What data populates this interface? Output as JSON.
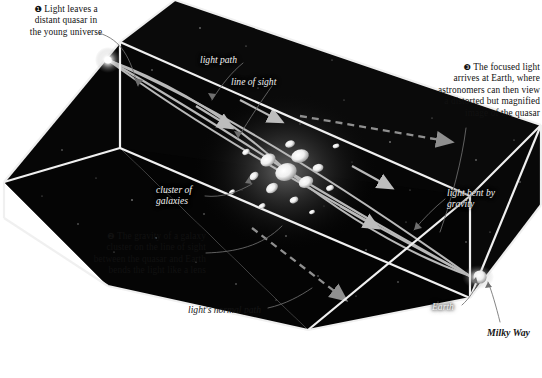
{
  "figure": {
    "background_color": "#ffffff",
    "box_fill": "#070707",
    "ray_color": "#b9b9b9",
    "dashed_ray_color": "#8f8f8f",
    "edge_color": "#f0f0f0",
    "label_color": "#f2f2f2",
    "caption_color": "#111111"
  },
  "captions": [
    {
      "marker": "❶",
      "text": "Light leaves a distant quasar in the young universe",
      "lines": [
        "Light leaves a",
        "distant quasar in",
        "the young universe"
      ]
    },
    {
      "marker": "❷",
      "text": "The gravity of a galaxy cluster on the line of sight between the quasar and Earth bends the light like a lens",
      "lines": [
        "The gravity of a galaxy",
        "cluster on the line of sight",
        "between the quasar and Earth",
        "bends the light like a lens"
      ]
    },
    {
      "marker": "❸",
      "text": "The focused light arrives at Earth, where astronomers can then view a distorted but magnified image of the quasar",
      "lines": [
        "The focused light",
        "arrives at Earth, where",
        "astronomers can then view",
        "a distorted but magnified",
        "image of the quasar"
      ]
    }
  ],
  "inner_labels": {
    "light_path": "light path",
    "line_of_sight": "line of sight",
    "cluster_line1": "cluster of",
    "cluster_line2": "galaxies",
    "bent_line1": "light bent by",
    "bent_line2": "gravity",
    "earth": "Earth"
  },
  "outer_labels": {
    "normal_path": "light's normal path",
    "milky_way": "Milky Way"
  },
  "objects": {
    "quasar": "quasar-point-source",
    "cluster": "galaxy-cluster",
    "earth": "earth-observer"
  },
  "credit": ""
}
